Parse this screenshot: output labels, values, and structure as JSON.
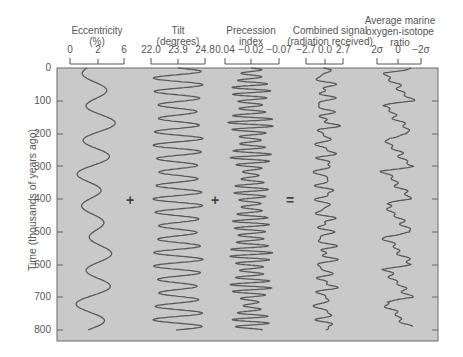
{
  "figure": {
    "ylabel": "Time (thousands of years ago)",
    "yticks": [
      "0",
      "100",
      "200",
      "300",
      "400",
      "500",
      "600",
      "700",
      "800"
    ],
    "columns": [
      {
        "title_line1": "Eccentricity",
        "title_line2": "(%)",
        "title_line3": "",
        "scale": [
          "0",
          "2",
          "6"
        ]
      },
      {
        "title_line1": "Tilt",
        "title_line2": "(degrees)",
        "title_line3": "",
        "scale": [
          "22.0",
          "23.9",
          "24.8"
        ]
      },
      {
        "title_line1": "Precession",
        "title_line2": "index",
        "title_line3": "",
        "scale": [
          "0.04",
          "−0.02",
          "−0.07"
        ]
      },
      {
        "title_line1": "Combined signal",
        "title_line2": "(radiation received)",
        "title_line3": "",
        "scale": [
          "−2.7",
          "0.0",
          "2.7"
        ]
      },
      {
        "title_line1": "Average marine",
        "title_line2": "oxygen-isotope",
        "title_line3": "ratio",
        "scale": [
          "2σ",
          "0",
          "−2σ"
        ]
      }
    ],
    "operators": [
      "+",
      "+",
      "="
    ],
    "colors": {
      "plot_bg": "#c8c8c8",
      "curve": "#555555",
      "frame": "#666666",
      "text": "#555555"
    }
  },
  "chart_data": {
    "type": "line",
    "title": "",
    "ylabel": "Time (thousands of years ago)",
    "ylim": [
      0,
      830
    ],
    "y_inverted": true,
    "grid": false,
    "series": [
      {
        "name": "Eccentricity (%)",
        "scale_ticks": [
          0,
          2,
          6
        ],
        "approx_peaks_kyr": [
          120,
          220,
          320,
          490,
          590,
          700
        ],
        "approx_troughs_kyr": [
          20,
          170,
          280,
          370,
          440,
          540,
          650,
          760
        ],
        "period_kyr": 100
      },
      {
        "name": "Tilt (degrees)",
        "scale_ticks": [
          22.0,
          23.9,
          24.8
        ],
        "period_kyr": 41
      },
      {
        "name": "Precession index",
        "scale_ticks": [
          0.04,
          -0.02,
          -0.07
        ],
        "period_kyr": 23,
        "note": "amplitude modulated by eccentricity"
      },
      {
        "name": "Combined signal (radiation received)",
        "scale_ticks": [
          -2.7,
          0.0,
          2.7
        ]
      },
      {
        "name": "Average marine oxygen-isotope ratio",
        "scale_ticks": [
          "2σ",
          "0",
          "-2σ"
        ],
        "note": "sawtooth ~100 kyr cycles"
      }
    ]
  }
}
